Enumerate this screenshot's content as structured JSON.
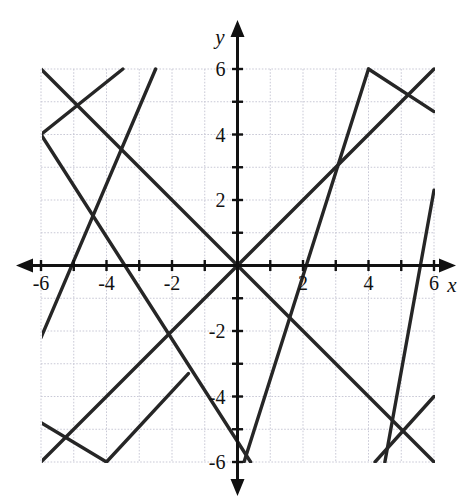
{
  "figure": {
    "kind": "coordinate-plane-graph",
    "axis_labels": {
      "x": "x",
      "y": "y"
    },
    "tick_labels_x": [
      "-6",
      "-4",
      "-2",
      "2",
      "4",
      "6"
    ],
    "tick_labels_y": [
      "6",
      "4",
      "2",
      "-2",
      "-4",
      "-6"
    ],
    "colors": {
      "grid": "#c9c9d6",
      "axis": "#111111",
      "line": "#262626",
      "background": "#ffffff"
    }
  },
  "chart_data": {
    "type": "line",
    "title": "",
    "xlabel": "x",
    "ylabel": "y",
    "xlim": [
      -6,
      6
    ],
    "ylim": [
      -6,
      6
    ],
    "grid": true,
    "legend": "none",
    "xticks": [
      -6,
      -5,
      -4,
      -3,
      -2,
      -1,
      0,
      1,
      2,
      3,
      4,
      5,
      6
    ],
    "yticks": [
      -6,
      -5,
      -4,
      -3,
      -2,
      -1,
      0,
      1,
      2,
      3,
      4,
      5,
      6
    ],
    "xtick_labels": {
      "-6": "-6",
      "-4": "-4",
      "-2": "-2",
      "2": "2",
      "4": "4",
      "6": "6"
    },
    "ytick_labels": {
      "6": "6",
      "4": "4",
      "2": "2",
      "-2": "-2",
      "-4": "-4",
      "-6": "-6"
    },
    "series": [
      {
        "name": "line-A-positive-slope-through-origin",
        "slope": 1,
        "intercept": 0,
        "equation": "y = x",
        "segments": [
          {
            "points": [
              [
                -6,
                -6
              ],
              [
                6,
                6
              ]
            ]
          }
        ]
      },
      {
        "name": "line-B-negative-slope-through-origin",
        "slope": -1,
        "intercept": 0,
        "equation": "y = -x",
        "segments": [
          {
            "points": [
              [
                -6,
                6
              ],
              [
                6,
                -6
              ]
            ]
          }
        ]
      },
      {
        "name": "line-C-positive-slope-offset",
        "slope": 1,
        "intercept": 6,
        "equation": "y = x + 6 (wrapped)",
        "segments": [
          {
            "points": [
              [
                -6,
                -2.2
              ],
              [
                -2.5,
                6
              ]
            ]
          },
          {
            "points": [
              [
                0.2,
                -6
              ],
              [
                4,
                6
              ]
            ]
          },
          {
            "points": [
              [
                4.5,
                -6
              ],
              [
                6,
                2.3
              ]
            ]
          }
        ]
      },
      {
        "name": "line-D-negative-slope-offset",
        "slope": -1,
        "intercept": -2,
        "equation": "y = -x - 2 (wrapped)",
        "segments": [
          {
            "points": [
              [
                -6,
                4
              ],
              [
                -3.5,
                6
              ]
            ]
          },
          {
            "points": [
              [
                -6,
                4
              ],
              [
                0.4,
                -6
              ]
            ]
          },
          {
            "points": [
              [
                4,
                6
              ],
              [
                6,
                4.7
              ]
            ]
          },
          {
            "points": [
              [
                -6,
                -4.8
              ],
              [
                -4,
                -6
              ]
            ]
          },
          {
            "points": [
              [
                -4,
                -6
              ],
              [
                -1.5,
                -3.3
              ]
            ]
          },
          {
            "points": [
              [
                6,
                -4
              ],
              [
                4.2,
                -6
              ]
            ]
          },
          {
            "points": [
              [
                6,
                -4
              ],
              [
                6,
                -4
              ]
            ]
          }
        ]
      }
    ],
    "vertices": [
      {
        "label": "left-vertex",
        "at": [
          -6,
          4
        ]
      },
      {
        "label": "bottom-left-vertex",
        "at": [
          -4,
          -6
        ]
      },
      {
        "label": "top-right-peak",
        "at": [
          4,
          6
        ]
      },
      {
        "label": "right-vertex",
        "at": [
          6,
          -4
        ]
      },
      {
        "label": "origin-crossing",
        "at": [
          0,
          0
        ]
      }
    ]
  }
}
